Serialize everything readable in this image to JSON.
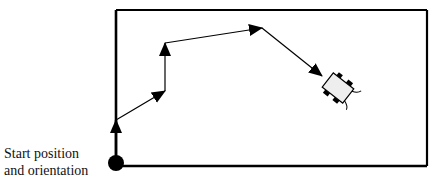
{
  "diagram": {
    "type": "robot-path",
    "start_label": {
      "line1": "Start position",
      "line2": "and orientation"
    },
    "boundary": {
      "x": 116,
      "y": 10,
      "width": 311,
      "height": 156
    },
    "start_point": {
      "x": 116,
      "y": 163,
      "radius": 8
    },
    "path_points": [
      {
        "x": 116,
        "y": 163
      },
      {
        "x": 116,
        "y": 120
      },
      {
        "x": 165,
        "y": 91
      },
      {
        "x": 165,
        "y": 43
      },
      {
        "x": 262,
        "y": 28
      },
      {
        "x": 322,
        "y": 76
      }
    ],
    "robot": {
      "cx": 338,
      "cy": 88,
      "angle_deg": 38
    },
    "colors": {
      "stroke": "#000000",
      "robot_fill": "#eeeeee"
    }
  }
}
